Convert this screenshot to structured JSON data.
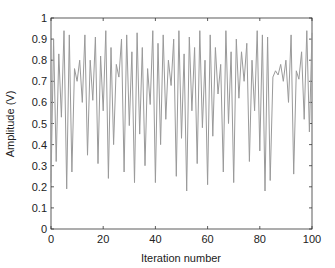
{
  "chart_data": {
    "type": "line",
    "title": "",
    "xlabel": "Iteration number",
    "ylabel": "Amplitude (V)",
    "xlim": [
      0,
      100
    ],
    "ylim": [
      0,
      1
    ],
    "xticks": [
      0,
      20,
      40,
      60,
      80,
      100
    ],
    "yticks": [
      0,
      0.1,
      0.2,
      0.3,
      0.4,
      0.5,
      0.6,
      0.7,
      0.8,
      0.9,
      1
    ],
    "xtick_labels": [
      "0",
      "20",
      "40",
      "60",
      "80",
      "100"
    ],
    "ytick_labels": [
      "0",
      "0.1",
      "0.2",
      "0.3",
      "0.4",
      "0.5",
      "0.6",
      "0.7",
      "0.8",
      "0.9",
      "1"
    ],
    "grid": false,
    "legend": null,
    "series": [
      {
        "name": "Amplitude",
        "color": "#9a9a9a",
        "x": [
          0,
          1,
          2,
          3,
          4,
          5,
          6,
          7,
          8,
          9,
          10,
          11,
          12,
          13,
          14,
          15,
          16,
          17,
          18,
          19,
          20,
          21,
          22,
          23,
          24,
          25,
          26,
          27,
          28,
          29,
          30,
          31,
          32,
          33,
          34,
          35,
          36,
          37,
          38,
          39,
          40,
          41,
          42,
          43,
          44,
          45,
          46,
          47,
          48,
          49,
          50,
          51,
          52,
          53,
          54,
          55,
          56,
          57,
          58,
          59,
          60,
          61,
          62,
          63,
          64,
          65,
          66,
          67,
          68,
          69,
          70,
          71,
          72,
          73,
          74,
          75,
          76,
          77,
          78,
          79,
          80,
          81,
          82,
          83,
          84,
          85,
          86,
          87,
          88,
          89,
          90,
          91,
          92,
          93,
          94,
          95,
          96,
          97,
          98,
          99,
          100
        ],
        "values": [
          0.22,
          0.9,
          0.32,
          0.83,
          0.53,
          0.94,
          0.19,
          0.92,
          0.27,
          0.76,
          0.7,
          0.8,
          0.6,
          0.92,
          0.35,
          0.8,
          0.61,
          0.91,
          0.31,
          0.82,
          0.56,
          0.94,
          0.24,
          0.86,
          0.4,
          0.78,
          0.72,
          0.9,
          0.27,
          0.92,
          0.49,
          0.84,
          0.22,
          0.93,
          0.45,
          0.86,
          0.3,
          0.76,
          0.59,
          0.94,
          0.22,
          0.88,
          0.4,
          0.92,
          0.52,
          0.8,
          0.68,
          0.9,
          0.25,
          0.94,
          0.43,
          0.83,
          0.18,
          0.91,
          0.56,
          0.86,
          0.31,
          0.94,
          0.48,
          0.8,
          0.21,
          0.92,
          0.44,
          0.86,
          0.64,
          0.78,
          0.27,
          0.94,
          0.5,
          0.84,
          0.22,
          0.9,
          0.62,
          0.84,
          0.7,
          0.88,
          0.32,
          0.8,
          0.56,
          0.94,
          0.37,
          0.92,
          0.18,
          0.91,
          0.23,
          0.72,
          0.75,
          0.73,
          0.78,
          0.7,
          0.8,
          0.6,
          0.92,
          0.26,
          0.75,
          0.71,
          0.84,
          0.52,
          0.94,
          0.46,
          0.93
        ]
      }
    ]
  },
  "plot_area": {
    "left": 51,
    "top": 18,
    "right": 312,
    "bottom": 229
  },
  "colors": {
    "axis": "#333333",
    "line": "#9a9a9a"
  }
}
